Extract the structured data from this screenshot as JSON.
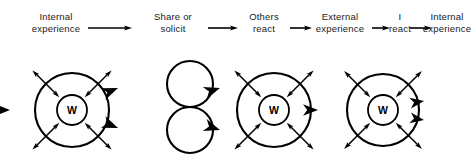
{
  "diagram": {
    "stroke_color": "#000000",
    "background_color": "#ffffff",
    "text_color": "#1a1a1a",
    "stages": [
      {
        "id": "internal-experience-start",
        "text": "Internal\nexperience",
        "cx": 56,
        "cy": 22
      },
      {
        "id": "share-or-solicit",
        "text": "Share or\nsolicit",
        "cx": 173,
        "cy": 22
      },
      {
        "id": "others-react",
        "text": "Others\nreact",
        "cx": 264,
        "cy": 22
      },
      {
        "id": "external-experience",
        "text": "External\nexperience",
        "cx": 340,
        "cy": 22
      },
      {
        "id": "i-react",
        "text": "I\nreact",
        "cx": 400,
        "cy": 22
      },
      {
        "id": "internal-experience-end",
        "text": "Internal\nexperience",
        "cx": 447,
        "cy": 22
      }
    ],
    "stage_connectors": [
      {
        "id": "connector-1",
        "x1": 88,
        "x2": 132,
        "y": 28
      },
      {
        "id": "connector-2",
        "x1": 208,
        "x2": 238,
        "y": 28
      },
      {
        "id": "connector-3",
        "x1": 290,
        "x2": 312,
        "y": 28
      },
      {
        "id": "connector-4",
        "x1": 372,
        "x2": 390,
        "y": 28
      },
      {
        "id": "connector-5",
        "x1": 410,
        "x2": 432,
        "y": 28
      }
    ],
    "self_nodes": [
      {
        "id": "self-node-1",
        "letter": "W",
        "cx": 72,
        "cy": 110,
        "outer_r": 37,
        "inner_r": 15
      },
      {
        "id": "self-node-2",
        "letter": "W",
        "cx": 274,
        "cy": 110,
        "outer_r": 37,
        "inner_r": 15
      },
      {
        "id": "self-node-3",
        "letter": "W",
        "cx": 383,
        "cy": 110,
        "outer_r": 36,
        "inner_r": 15
      }
    ],
    "other_nodes": [
      {
        "id": "other-node-top",
        "cx": 190,
        "cy": 84,
        "r": 23
      },
      {
        "id": "other-node-bottom",
        "cx": 190,
        "cy": 130,
        "r": 23
      }
    ],
    "flow_arrowheads": [
      {
        "id": "flow-into-self-1",
        "x": 10,
        "y": 110,
        "angle": 0,
        "size": 15
      },
      {
        "id": "flow-self1-to-other-top",
        "x": 118,
        "y": 88,
        "angle": -22,
        "size": 16
      },
      {
        "id": "flow-self1-to-other-bottom",
        "x": 118,
        "y": 128,
        "angle": 22,
        "size": 16
      },
      {
        "id": "flow-other-top-to-self2",
        "x": 220,
        "y": 88,
        "angle": -18,
        "size": 16
      },
      {
        "id": "flow-other-bottom-to-self2",
        "x": 220,
        "y": 130,
        "angle": 18,
        "size": 16
      },
      {
        "id": "flow-self2-to-self3",
        "x": 318,
        "y": 110,
        "angle": 0,
        "size": 15
      },
      {
        "id": "flow-out-upper",
        "x": 424,
        "y": 101,
        "angle": -9,
        "size": 14
      },
      {
        "id": "flow-out-lower",
        "x": 424,
        "y": 120,
        "angle": 9,
        "size": 14
      }
    ],
    "radial_arrow_angles": [
      -135,
      -45,
      45,
      135
    ]
  }
}
